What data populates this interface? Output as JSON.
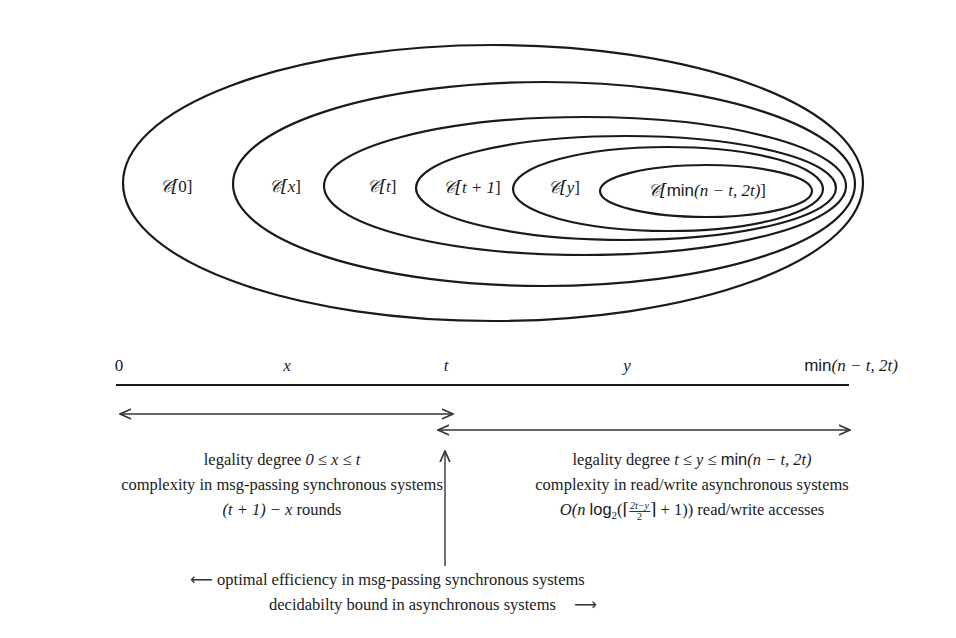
{
  "diagram": {
    "type": "nested-ellipses-with-axis",
    "sets": [
      {
        "id": "c0",
        "label": "𝒞[0]",
        "prefix": "C",
        "arg": "0",
        "ellipse": {
          "cx": 493,
          "cy": 183,
          "rx": 370,
          "ry": 138
        }
      },
      {
        "id": "cx",
        "label": "𝒞[x]",
        "prefix": "C",
        "arg": "x",
        "ellipse": {
          "cx": 544,
          "cy": 184,
          "rx": 311,
          "ry": 102
        }
      },
      {
        "id": "ct",
        "label": "𝒞[t]",
        "prefix": "C",
        "arg": "t",
        "ellipse": {
          "cx": 585,
          "cy": 186,
          "rx": 261,
          "ry": 69
        }
      },
      {
        "id": "ct1",
        "label": "𝒞[t + 1]",
        "prefix": "C",
        "arg": "t + 1",
        "ellipse": {
          "cx": 626,
          "cy": 188,
          "rx": 210,
          "ry": 52
        }
      },
      {
        "id": "cy",
        "label": "𝒞[y]",
        "prefix": "C",
        "arg": "y",
        "ellipse": {
          "cx": 668,
          "cy": 189,
          "rx": 155,
          "ry": 42
        }
      },
      {
        "id": "cmin",
        "label": "𝒞[min(n − t, 2t)]",
        "prefix": "C",
        "arg": "min(n − t, 2t)",
        "ellipse": {
          "cx": 706,
          "cy": 191,
          "rx": 106,
          "ry": 26
        }
      }
    ],
    "set_labels": {
      "c0": {
        "pre": "𝒞[",
        "mid": "0",
        "post": "]"
      },
      "cx": {
        "pre": "𝒞[",
        "mid": "x",
        "post": "]"
      },
      "ct": {
        "pre": "𝒞[",
        "mid": "t",
        "post": "]"
      },
      "ct1": {
        "pre": "𝒞[",
        "mid": "t + 1",
        "post": "]"
      },
      "cy": {
        "pre": "𝒞[",
        "mid": "y",
        "post": "]"
      },
      "cmin": {
        "pre": "𝒞[",
        "fn": "min",
        "mid": "(n − t, 2t)",
        "post": "]"
      }
    },
    "axis": {
      "ticks": [
        {
          "label": "0",
          "x": 119
        },
        {
          "label": "x",
          "x": 287
        },
        {
          "label": "t",
          "x": 446
        },
        {
          "label": "y",
          "x": 627
        },
        {
          "fn": "min",
          "rest": "(n − t, 2t)",
          "x": 851
        }
      ]
    },
    "left_region": {
      "line1_text": "legality degree ",
      "line1_math": "0 ≤ x ≤ t",
      "line2": "complexity in msg-passing synchronous systems",
      "line3_math": "(t + 1) − x",
      "line3_text": " rounds"
    },
    "right_region": {
      "line1_text": "legality degree ",
      "line1_math_a": "t ≤ y ≤ ",
      "line1_fn": "min",
      "line1_math_b": "(n − t, 2t)",
      "line2": "complexity in read/write asynchronous systems",
      "line3_pre": "O",
      "line3_a": "(n ",
      "line3_fn": "log",
      "line3_sub": "2",
      "line3_b": "(⌈",
      "line3_frac_num": "2t−y",
      "line3_frac_den": "2",
      "line3_c": "⌉ + 1))",
      "line3_text": " read/write accesses"
    },
    "footer": {
      "left_arrow": "⟵",
      "line1": "optimal efficiency in msg-passing synchronous systems",
      "line2": "decidabilty bound in asynchronous systems",
      "right_arrow": "⟶"
    }
  }
}
